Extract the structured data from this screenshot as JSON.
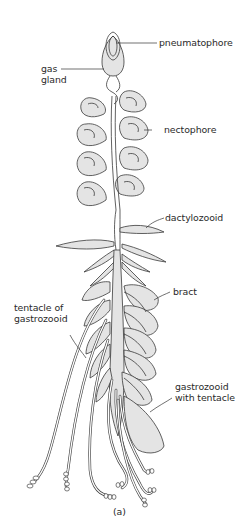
{
  "figure": {
    "caption": "(a)",
    "labels": {
      "pneumatophore": "pneumatophore",
      "gas_gland_line1": "gas",
      "gas_gland_line2": "gland",
      "nectophore": "nectophore",
      "dactylozooid": "dactylozooid",
      "bract": "bract",
      "tentacle_line1": "tentacle of",
      "tentacle_line2": "gastrozooid",
      "gastrozooid_line1": "gastrozooid",
      "gastrozooid_line2": "with tentacle"
    }
  }
}
